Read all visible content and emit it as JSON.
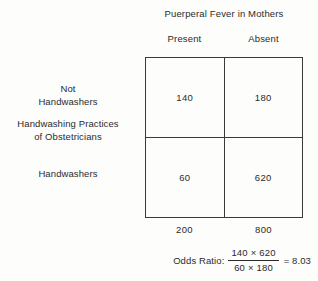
{
  "figure": {
    "column_group_title": "Puerperal Fever in Mothers",
    "row_group_label_line1": "Handwashing Practices",
    "row_group_label_line2": "of Obstetricians",
    "column_headers": [
      "Present",
      "Absent"
    ],
    "row_labels": [
      {
        "line1": "Not",
        "line2": "Handwashers"
      },
      {
        "line1": "Handwashers",
        "line2": ""
      }
    ],
    "cells": [
      [
        "140",
        "180"
      ],
      [
        "60",
        "620"
      ]
    ],
    "column_totals": [
      "200",
      "800"
    ],
    "odds_ratio": {
      "label": "Odds Ratio:",
      "numerator": "140 × 620",
      "denominator": "60 × 180",
      "result": "= 8.03"
    }
  },
  "chart_data": {
    "type": "table",
    "title": "Puerperal Fever in Mothers",
    "row_variable": "Handwashing Practices of Obstetricians",
    "column_variable": "Puerperal Fever in Mothers",
    "categories": [
      "Present",
      "Absent"
    ],
    "row_categories": [
      "Not Handwashers",
      "Handwashers"
    ],
    "values": [
      [
        140,
        180
      ],
      [
        60,
        620
      ]
    ],
    "column_totals": [
      200,
      800
    ],
    "odds_ratio_value": 8.03,
    "odds_ratio_expression": "(140 × 620) / (60 × 180) = 8.03",
    "grid": true,
    "legend": "none"
  }
}
